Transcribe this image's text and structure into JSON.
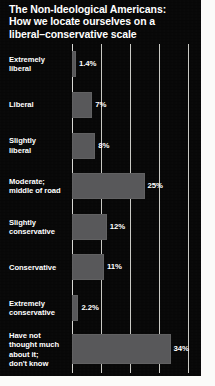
{
  "chart_data": {
    "type": "bar",
    "orientation": "horizontal",
    "title": "The Non-Ideological Americans:\nHow we locate ourselves on a\nliberal–conservative scale",
    "xlabel": "",
    "ylabel": "",
    "xlim": [
      0,
      40
    ],
    "grid": true,
    "gridlines": [
      0,
      10,
      20,
      30,
      40
    ],
    "legend": "none",
    "categories": [
      "Extremely\nliberal",
      "Liberal",
      "Slightly\nliberal",
      "Moderate;\nmiddle of road",
      "Slightly\nconservative",
      "Conservative",
      "Extremely\nconservative",
      "Have not\nthought much\nabout it;\ndon't know"
    ],
    "values": [
      1.4,
      7,
      8,
      25,
      12,
      11,
      2.2,
      34
    ],
    "value_labels": [
      "1.4%",
      "7%",
      "8%",
      "25%",
      "12%",
      "11%",
      "2.2%",
      "34%"
    ],
    "colors": {
      "background": "#070707",
      "bar": "#58585a",
      "text": "#ffffff",
      "gridline": "#c9c9c4"
    }
  }
}
